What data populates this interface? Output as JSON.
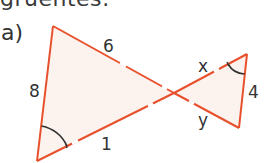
{
  "heading": {
    "text": "gruentes:"
  },
  "part": {
    "label": "a)"
  },
  "diagram": {
    "colors": {
      "line": "#e8502c",
      "fill": "#fdf3ee",
      "arc": "#333333",
      "text": "#333333"
    },
    "vertices": {
      "A_top_left": [
        53,
        26
      ],
      "B_bottom_left": [
        37,
        161
      ],
      "C_top_right": [
        247,
        54
      ],
      "D_bottom_right": [
        239,
        128
      ],
      "O_intersection": [
        174,
        93
      ]
    },
    "labels": {
      "side_top": "6",
      "side_left": "8",
      "side_bottom": "1",
      "side_x": "x",
      "side_y": "y",
      "side_right": "4"
    },
    "angle_marks": [
      {
        "vertex": "B_bottom_left",
        "description": "marked angle arc"
      },
      {
        "vertex": "C_top_right",
        "description": "marked angle arc"
      }
    ]
  }
}
